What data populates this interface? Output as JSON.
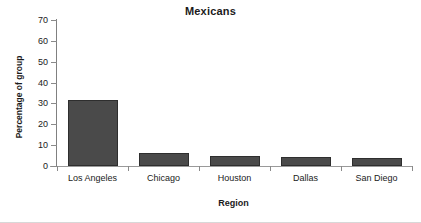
{
  "chart_data": {
    "type": "bar",
    "title": "Mexicans",
    "xlabel": "Region",
    "ylabel": "Percentage of group",
    "categories": [
      "Los Angeles",
      "Chicago",
      "Houston",
      "Dallas",
      "San Diego"
    ],
    "values": [
      31.5,
      6.1,
      4.8,
      4.1,
      3.9
    ],
    "ylim": [
      0,
      70
    ],
    "ytick_labels": [
      "0",
      "10",
      "20",
      "30",
      "40",
      "50",
      "60",
      "70"
    ],
    "yticks": [
      0,
      10,
      20,
      30,
      40,
      50,
      60,
      70
    ],
    "grid": false,
    "legend": false,
    "series": [
      {
        "name": "Mexicans",
        "values": [
          31.5,
          6.1,
          4.8,
          4.1,
          3.9
        ],
        "color": "#4a4a4a"
      }
    ]
  },
  "style": {
    "bar_fill": "#4a4a4a",
    "bar_border": "#2e2e2e",
    "axis_color": "#8a8a8a",
    "text_color": "#1a1a1a",
    "background": "#ffffff"
  }
}
